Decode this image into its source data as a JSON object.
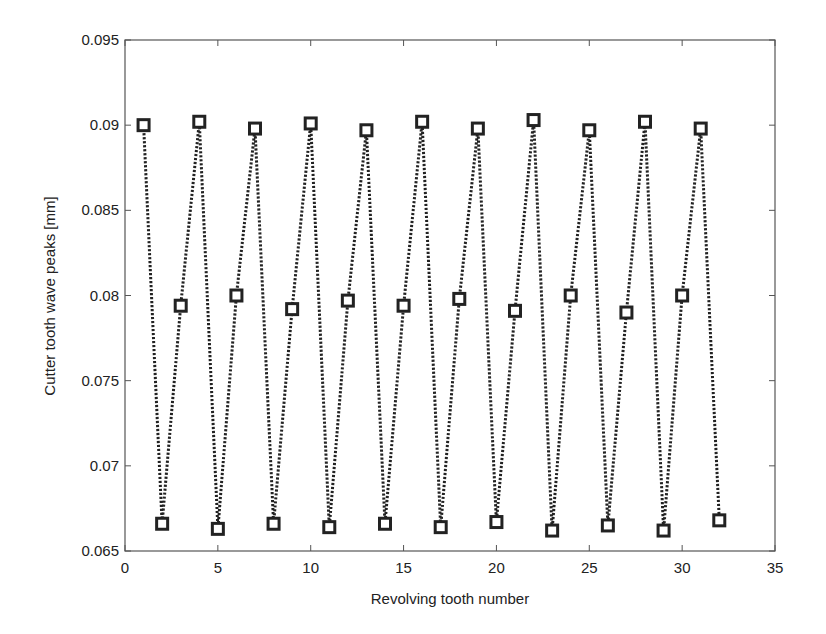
{
  "chart_data": {
    "type": "line",
    "title": "",
    "xlabel": "Revolving tooth number",
    "ylabel": "Cutter tooth wave peaks [mm]",
    "xlim": [
      0,
      35
    ],
    "ylim": [
      0.065,
      0.095
    ],
    "xticks": [
      0,
      5,
      10,
      15,
      20,
      25,
      30,
      35
    ],
    "yticks": [
      0.065,
      0.07,
      0.075,
      0.08,
      0.085,
      0.09,
      0.095
    ],
    "xtick_labels": [
      "0",
      "5",
      "10",
      "15",
      "20",
      "25",
      "30",
      "35"
    ],
    "ytick_labels": [
      "0.065",
      "0.07",
      "0.075",
      "0.08",
      "0.085",
      "0.09",
      "0.095"
    ],
    "grid": false,
    "legend": null,
    "series": [
      {
        "name": "Cutter tooth wave peaks",
        "line_style": "dotted",
        "marker": "square",
        "color": "#222222",
        "x": [
          1,
          2,
          3,
          4,
          5,
          6,
          7,
          8,
          9,
          10,
          11,
          12,
          13,
          14,
          15,
          16,
          17,
          18,
          19,
          20,
          21,
          22,
          23,
          24,
          25,
          26,
          27,
          28,
          29,
          30,
          31,
          32
        ],
        "values": [
          0.09,
          0.0666,
          0.0794,
          0.0902,
          0.0663,
          0.08,
          0.0898,
          0.0666,
          0.0792,
          0.0901,
          0.0664,
          0.0797,
          0.0897,
          0.0666,
          0.0794,
          0.0902,
          0.0664,
          0.0798,
          0.0898,
          0.0667,
          0.0791,
          0.0903,
          0.0662,
          0.08,
          0.0897,
          0.0665,
          0.079,
          0.0902,
          0.0662,
          0.08,
          0.0898,
          0.0668
        ]
      }
    ]
  }
}
